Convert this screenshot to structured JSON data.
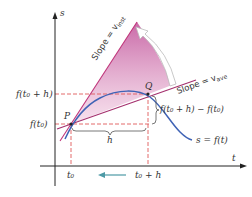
{
  "diagram": {
    "axes": {
      "y_label": "s",
      "x_label": "t"
    },
    "points": {
      "P": "P",
      "Q": "Q"
    },
    "y_ticks": {
      "upper": "f(t₀ + h)",
      "lower": "f(t₀)"
    },
    "x_ticks": {
      "left": "t₀",
      "right": "t₀ + h"
    },
    "labels": {
      "slope_inst": "Slope = v",
      "slope_inst_sub": "inst",
      "slope_ave": "Slope = v",
      "slope_ave_sub": "ave",
      "h": "h",
      "difference": "f(t₀ + h) − f(t₀)",
      "curve": "s = f(t)"
    },
    "colors": {
      "curve": "#3f63b5",
      "tangent": "#c0357a",
      "secant": "#a4306e",
      "fill": "#d88bbd",
      "dashed": "#e05a5a",
      "arrow": "#4d9aa6",
      "axis": "#222222"
    }
  }
}
